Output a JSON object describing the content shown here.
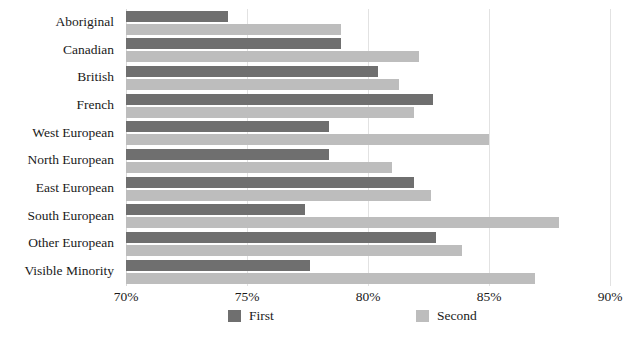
{
  "chart_data": {
    "type": "bar",
    "orientation": "horizontal",
    "title": "",
    "subtitle": "",
    "xlabel": "",
    "ylabel": "",
    "xlim": [
      70,
      90
    ],
    "xticks": [
      70,
      75,
      80,
      85,
      90
    ],
    "xtick_labels": [
      "70%",
      "75%",
      "80%",
      "85%",
      "90%"
    ],
    "grid": true,
    "grid_axis": "x",
    "legend_position": "bottom",
    "categories": [
      "Aboriginal",
      "Canadian",
      "British",
      "French",
      "West European",
      "North European",
      "East European",
      "South European",
      "Other European",
      "Visible Minority"
    ],
    "series": [
      {
        "name": "First",
        "color": "#6f6f6f",
        "values": [
          74.2,
          78.9,
          80.4,
          82.7,
          78.4,
          78.4,
          81.9,
          77.4,
          82.8,
          77.6
        ]
      },
      {
        "name": "Second",
        "color": "#bdbdbd",
        "values": [
          78.9,
          82.1,
          81.3,
          81.9,
          85.0,
          81.0,
          82.6,
          87.9,
          83.9,
          86.9
        ]
      }
    ]
  },
  "legend": {
    "items": [
      {
        "label": "First",
        "color": "#6f6f6f"
      },
      {
        "label": "Second",
        "color": "#bdbdbd"
      }
    ]
  }
}
